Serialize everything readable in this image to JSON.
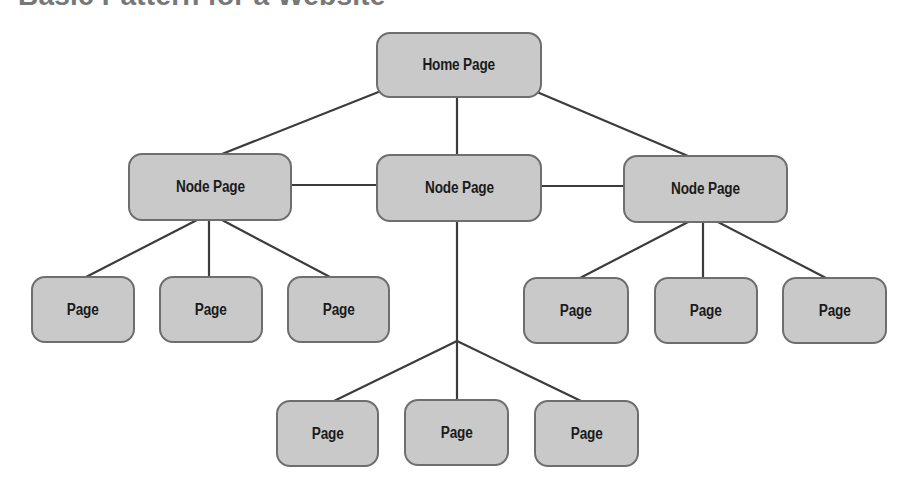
{
  "title": "Basic Pattern for a Website",
  "colors": {
    "node_fill": "#c9c9c9",
    "node_border": "#6e6e6e",
    "line": "#3c3c3c",
    "text": "#1b1b1b",
    "title": "#777777"
  },
  "nodes": {
    "home": {
      "label": "Home Page"
    },
    "node_left": {
      "label": "Node Page"
    },
    "node_center": {
      "label": "Node Page"
    },
    "node_right": {
      "label": "Node Page"
    },
    "left_pages": [
      {
        "label": "Page"
      },
      {
        "label": "Page"
      },
      {
        "label": "Page"
      }
    ],
    "right_pages": [
      {
        "label": "Page"
      },
      {
        "label": "Page"
      },
      {
        "label": "Page"
      }
    ],
    "bottom_pages": [
      {
        "label": "Page"
      },
      {
        "label": "Page"
      },
      {
        "label": "Page"
      }
    ]
  }
}
